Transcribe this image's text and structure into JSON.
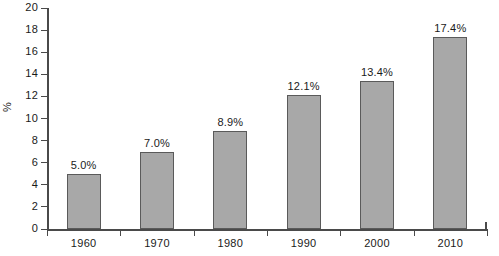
{
  "chart_data": {
    "type": "bar",
    "title": "",
    "subtitle": "",
    "xlabel": "",
    "ylabel": "%",
    "categories": [
      "1960",
      "1970",
      "1980",
      "1990",
      "2000",
      "2010"
    ],
    "values": [
      5.0,
      7.0,
      8.9,
      12.1,
      13.4,
      17.4
    ],
    "data_labels": [
      "5.0%",
      "7.0%",
      "8.9%",
      "12.1%",
      "13.4%",
      "17.4%"
    ],
    "ylim": [
      0,
      20
    ],
    "ytick_step": 2,
    "ytick_labels": [
      "0",
      "2",
      "4",
      "6",
      "8",
      "10",
      "12",
      "14",
      "16",
      "18",
      "20"
    ],
    "grid": false,
    "legend": false,
    "legend_position": "none",
    "series": [
      {
        "name": "",
        "values": [
          5.0,
          7.0,
          8.9,
          12.1,
          13.4,
          17.4
        ]
      }
    ],
    "colors": {
      "bar_fill": "#a8a8a8",
      "bar_outline": "#5a5a5a",
      "axis": "#4a4a4a",
      "text": "#1a1a1a",
      "background": "#ffffff"
    }
  }
}
